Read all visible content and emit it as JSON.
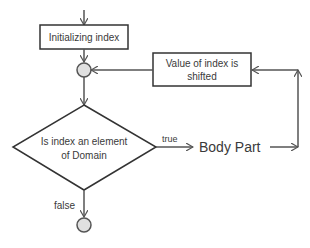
{
  "diagram": {
    "type": "flowchart",
    "colors": {
      "stroke": "#555555",
      "box_border": "#333333",
      "node_fill": "#e0e0e0",
      "text": "#3a3a3a"
    },
    "nodes": {
      "init": {
        "label": "Initializing index"
      },
      "shift": {
        "line1": "Value of index is",
        "line2": "shifted"
      },
      "decision": {
        "line1": "Is index an element",
        "line2": "of Domain"
      },
      "body": {
        "label": "Body Part"
      }
    },
    "edges": {
      "true_label": "true",
      "false_label": "false"
    }
  }
}
